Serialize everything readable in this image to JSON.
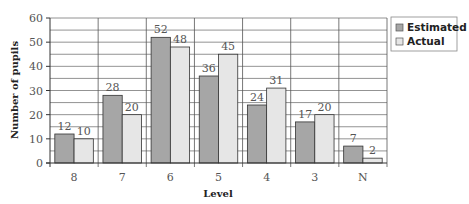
{
  "chart_data": {
    "type": "bar",
    "title": "",
    "xlabel": "Level",
    "ylabel": "Number of pupils",
    "categories": [
      "8",
      "7",
      "6",
      "5",
      "4",
      "3",
      "N"
    ],
    "series": [
      {
        "name": "Estimated",
        "color": "#a6a6a6",
        "values": [
          12,
          28,
          52,
          36,
          24,
          17,
          7
        ]
      },
      {
        "name": "Actual",
        "color": "#e6e6e6",
        "values": [
          10,
          20,
          48,
          45,
          31,
          20,
          2
        ]
      }
    ],
    "ylim": [
      0,
      60
    ],
    "yticks": [
      0,
      10,
      20,
      30,
      40,
      50,
      60
    ],
    "minor_grid_step": 5,
    "grid": true,
    "legend_position": "top-right",
    "data_labels": true
  }
}
